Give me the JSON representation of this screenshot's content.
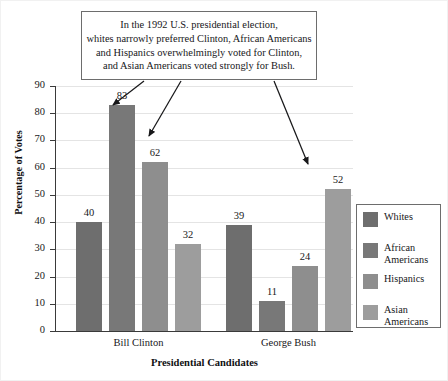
{
  "callout": {
    "lines": [
      "In the 1992 U.S. presidential election,",
      "whites narrowly preferred Clinton, African Americans",
      "and Hispanics overwhelmingly voted for Clinton,",
      "and Asian Americans voted strongly for Bush."
    ]
  },
  "chart_data": {
    "type": "bar",
    "title": "",
    "xlabel": "Presidential Candidates",
    "ylabel": "Percentage of Votes",
    "categories": [
      "Bill Clinton",
      "George Bush"
    ],
    "series": [
      {
        "name": "Whites",
        "values": [
          40,
          39
        ],
        "color": "#6e6e6e"
      },
      {
        "name": "African Americans",
        "values": [
          83,
          11
        ],
        "color": "#787878"
      },
      {
        "name": "Hispanics",
        "values": [
          62,
          24
        ],
        "color": "#8e8e8e"
      },
      {
        "name": "Asian Americans",
        "values": [
          32,
          52
        ],
        "color": "#9d9d9d"
      }
    ],
    "ylim": [
      0,
      90
    ],
    "yticks": [
      0,
      10,
      20,
      30,
      40,
      50,
      60,
      70,
      80,
      90
    ],
    "grid": true,
    "legend_position": "right",
    "value_labels": true,
    "annotations": [
      {
        "name": "arrow-to-whites-clinton",
        "x1": 143,
        "y1": 80,
        "x2": 112,
        "y2": 104
      },
      {
        "name": "arrow-to-hispanics-clinton",
        "x1": 180,
        "y1": 80,
        "x2": 148,
        "y2": 135
      },
      {
        "name": "arrow-to-asian-bush",
        "x1": 273,
        "y1": 80,
        "x2": 307,
        "y2": 163
      }
    ]
  },
  "legend": {
    "items": [
      {
        "label": "Whites",
        "color": "#6e6e6e"
      },
      {
        "label": "African Americans",
        "color": "#787878"
      },
      {
        "label": "Hispanics",
        "color": "#8e8e8e"
      },
      {
        "label": "Asian Americans",
        "color": "#9d9d9d"
      }
    ]
  }
}
